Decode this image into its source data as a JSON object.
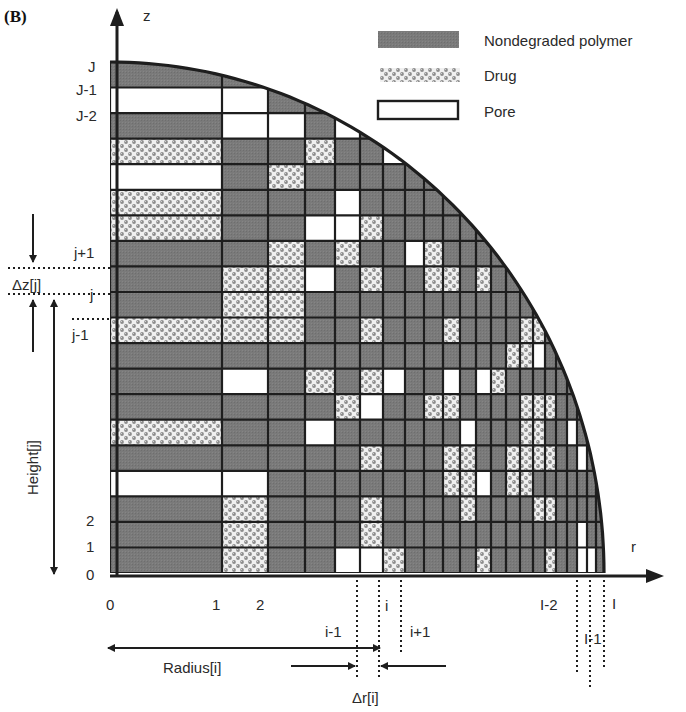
{
  "panel_label": "(B)",
  "axes": {
    "z_label": "z",
    "r_label": "r",
    "z_ticks": [
      "J",
      "J-1",
      "J-2",
      "j+1",
      "j",
      "j-1",
      "2",
      "1",
      "0"
    ],
    "r_ticks": [
      "0",
      "1",
      "2",
      "i-1",
      "i",
      "i+1",
      "I-2",
      "I-1",
      "I"
    ]
  },
  "legend": {
    "items": [
      {
        "key": "polymer",
        "label": "Nondegraded polymer"
      },
      {
        "key": "drug",
        "label": "Drug"
      },
      {
        "key": "pore",
        "label": "Pore"
      }
    ]
  },
  "annotations": {
    "delta_z": "Δz[j]",
    "height": "Height[j]",
    "radius": "Radius[i]",
    "delta_r": "Δr[i]"
  },
  "colors": {
    "polymer": "#7a7a7a",
    "drug_bg": "#f2f2f2",
    "drug_dot": "#8a8a8a",
    "pore": "#ffffff",
    "line": "#1e1e1e"
  },
  "grid": {
    "description": "Quarter-cylinder cross-section discretized into rows (z) and columns (r); each cell is polymer (P), drug (D) or pore (O). Rows listed top (J) to bottom (0).",
    "col_edges": [
      110,
      222,
      268,
      305,
      335,
      360,
      383,
      405,
      424,
      443,
      460,
      476,
      491,
      506,
      520,
      533,
      545,
      556,
      567,
      577,
      587,
      596,
      604
    ],
    "row_top": 62,
    "row_bottom": 573,
    "rows": [
      "PPPPPPPPPPPPPPPPPPPPPP",
      "OOPPPPPPPPPPPPPPPPPPPP",
      "POOPOPPPPPPPPPPPPPPPPP",
      "DPPDPPOPPPPPPPPPPPPPPP",
      "OPDPPPPPPOPPPPPPPPPPPP",
      "DPPPOPPPPPPOPPPPPPPPPP",
      "DPPOODPPPPPPOPPPPPPPPP",
      "PPDPDPPODPPPPPPPPPPPPP",
      "PDDOPDPPDDPDPPPPPPPPPP",
      "PDDPPPPPPPPPPPPPPPPPPP",
      "DDDPPDPPPDPPPPDDPPOPPP",
      "PPPPPPPPPPPPPDDOPPOPPP",
      "POPDPDOPPOPODPPPPPPPPP",
      "PPPPDOPPDDPPPPDDDPPPPP",
      "DPPOPPPPPPOPPPDDPPOPPP",
      "PPPPPDPPPDDPPDDDDPPOPP",
      "OOPPPPPPPDDOPDDPPPPPPP",
      "PDPPPDPPPPDPPPPDDPPPPP",
      "PDPPPDPPPPPPPPPPPPPOPP",
      "PDPPOODPPPPDPPPPDPPOOP"
    ]
  }
}
